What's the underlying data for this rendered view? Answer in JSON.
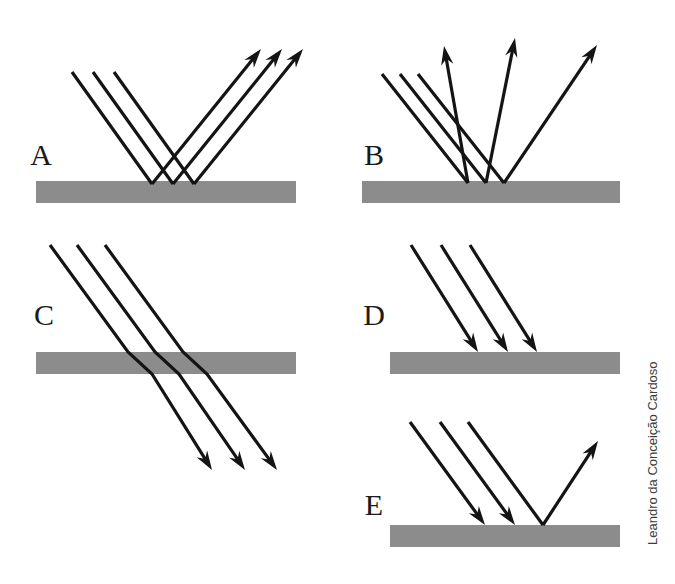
{
  "figure": {
    "background_color": "#ffffff",
    "ray_color": "#141414",
    "surface_color": "#8c8c8c",
    "label_color": "#1a1a1a",
    "credit": "Leandro da Conceição Cardoso"
  },
  "panels": [
    {
      "id": "A",
      "label": "A",
      "label_x": 41,
      "label_y": 158,
      "phenomenon": "specular-reflection",
      "surface": {
        "x": 36,
        "y": 181,
        "width": 260,
        "height": 22
      },
      "rays": [
        {
          "name": "incident-ray-1",
          "points": "72,72 152,184",
          "arrow": "none"
        },
        {
          "name": "incident-ray-2",
          "points": "93,72 173,184",
          "arrow": "none"
        },
        {
          "name": "incident-ray-3",
          "points": "114,72 194,184",
          "arrow": "none"
        },
        {
          "name": "reflected-ray-1",
          "points": "152,184 261,49",
          "arrow": "end"
        },
        {
          "name": "reflected-ray-2",
          "points": "173,184 282,49",
          "arrow": "end"
        },
        {
          "name": "reflected-ray-3",
          "points": "194,184 303,49",
          "arrow": "end"
        }
      ]
    },
    {
      "id": "B",
      "label": "B",
      "label_x": 374,
      "label_y": 158,
      "phenomenon": "diffuse-reflection",
      "surface": {
        "x": 362,
        "y": 181,
        "width": 258,
        "height": 22
      },
      "rays": [
        {
          "name": "incident-ray-1",
          "points": "382,74 468,183",
          "arrow": "none"
        },
        {
          "name": "incident-ray-2",
          "points": "400,74 486,183",
          "arrow": "none"
        },
        {
          "name": "incident-ray-3",
          "points": "418,74 504,183",
          "arrow": "none"
        },
        {
          "name": "scattered-ray-1",
          "points": "468,183 444,46",
          "arrow": "end"
        },
        {
          "name": "scattered-ray-2",
          "points": "486,183 515,38",
          "arrow": "end"
        },
        {
          "name": "scattered-ray-3",
          "points": "504,183 597,45",
          "arrow": "end"
        }
      ]
    },
    {
      "id": "C",
      "label": "C",
      "label_x": 44,
      "label_y": 318,
      "phenomenon": "refraction-transmission",
      "surface": {
        "x": 36,
        "y": 352,
        "width": 260,
        "height": 22
      },
      "rays": [
        {
          "name": "incident-ray-1",
          "points": "50,245 128,352 152,374 212,470",
          "arrow": "end"
        },
        {
          "name": "incident-ray-2",
          "points": "77,245 155,352 179,374 245,470",
          "arrow": "end"
        },
        {
          "name": "incident-ray-3",
          "points": "105,245 183,352 207,374 277,470",
          "arrow": "end"
        }
      ]
    },
    {
      "id": "D",
      "label": "D",
      "label_x": 374,
      "label_y": 318,
      "phenomenon": "absorption",
      "surface": {
        "x": 390,
        "y": 352,
        "width": 230,
        "height": 22
      },
      "rays": [
        {
          "name": "absorbed-ray-1",
          "points": "411,245 478,352",
          "arrow": "end"
        },
        {
          "name": "absorbed-ray-2",
          "points": "441,245 508,352",
          "arrow": "end"
        },
        {
          "name": "absorbed-ray-3",
          "points": "470,245 537,352",
          "arrow": "end"
        }
      ]
    },
    {
      "id": "E",
      "label": "E",
      "label_x": 374,
      "label_y": 508,
      "phenomenon": "partial-absorption-with-reflection",
      "surface": {
        "x": 390,
        "y": 525,
        "width": 230,
        "height": 22
      },
      "rays": [
        {
          "name": "absorbed-ray-1",
          "points": "410,422 485,525",
          "arrow": "end"
        },
        {
          "name": "absorbed-ray-2",
          "points": "440,422 515,525",
          "arrow": "end"
        },
        {
          "name": "incident-ray-3",
          "points": "468,422 543,525",
          "arrow": "none"
        },
        {
          "name": "reflected-ray-1",
          "points": "543,525 598,441",
          "arrow": "end"
        }
      ]
    }
  ]
}
